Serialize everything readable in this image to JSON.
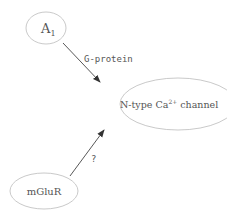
{
  "nodes": {
    "a1": {
      "label": "A",
      "subscript": "1"
    },
    "channel": {
      "label_pre": "N-type Ca",
      "superscript": "2+",
      "label_post": " channel"
    },
    "mglur": {
      "label": "mGluR"
    }
  },
  "edges": {
    "a1_to_channel": {
      "label": "G-protein"
    },
    "mglur_to_channel": {
      "label": "?"
    }
  },
  "colors": {
    "node_stroke": "#bbbbbb",
    "edge": "#444444",
    "text": "#555555"
  }
}
